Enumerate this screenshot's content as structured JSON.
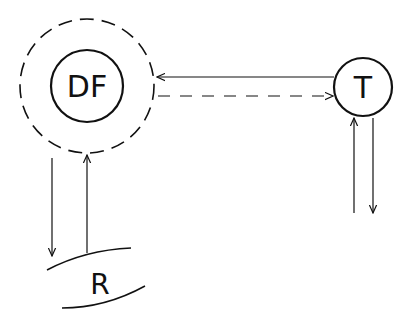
{
  "diagram": {
    "nodes": [
      {
        "id": "DF",
        "label": "DF",
        "shape": "circle",
        "surrounded_by": "dashed-circle"
      },
      {
        "id": "T",
        "label": "T",
        "shape": "circle"
      },
      {
        "id": "R",
        "label": "R",
        "shape": "arc-band"
      }
    ],
    "edges": [
      {
        "from": "T",
        "to": "DF",
        "style": "solid"
      },
      {
        "from": "DF",
        "to": "T",
        "style": "dashed"
      },
      {
        "from": "DF",
        "to": "R",
        "style": "solid"
      },
      {
        "from": "R",
        "to": "DF",
        "style": "solid"
      },
      {
        "from": "external",
        "to": "T",
        "style": "solid"
      },
      {
        "from": "T",
        "to": "external",
        "style": "solid"
      }
    ],
    "colors": {
      "stroke": "#111111",
      "background": "#ffffff"
    }
  }
}
